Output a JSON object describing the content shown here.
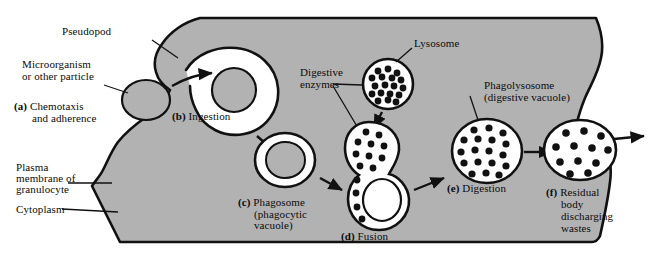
{
  "figure": {
    "background_color": "#ffffff",
    "cell_fill": "#b2b2b2",
    "vacuole_fill": "#ffffff",
    "granule_color": "#111111",
    "outline_color": "#111111"
  },
  "annotations": {
    "pseudopod": "Pseudopod",
    "microorganism_line1": "Microorganism",
    "microorganism_line2": "or other particle",
    "plasma_membrane_line1": "Plasma",
    "plasma_membrane_line2": "membrane of",
    "plasma_membrane_line3": "granulocyte",
    "cytoplasm": "Cytoplasm",
    "digestive_enzymes_line1": "Digestive",
    "digestive_enzymes_line2": "enzymes",
    "lysosome": "Lysosome",
    "phagolysosome_line1": "Phagolysosome",
    "phagolysosome_line2": "(digestive vacuole)"
  },
  "stages": {
    "a": {
      "tag": "(a)",
      "line1": " Chemotaxis",
      "line2": "and adherence"
    },
    "b": {
      "tag": "(b)",
      "line1": " Ingestion"
    },
    "c": {
      "tag": "(c)",
      "line1": " Phagosome",
      "line2": "(phagocytic",
      "line3": "vacuole)"
    },
    "d": {
      "tag": "(d)",
      "line1": " Fusion"
    },
    "e": {
      "tag": "(e)",
      "line1": " Digestion"
    },
    "f": {
      "tag": "(f)",
      "line1": " Residual",
      "line2": "body",
      "line3": "discharging",
      "line4": "wastes"
    }
  }
}
